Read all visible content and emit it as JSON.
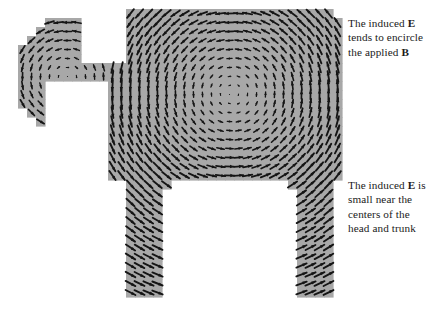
{
  "figure": {
    "name": "induced-electric-field-vector-plot",
    "background_color": "#ffffff",
    "mesh_fill_color": "#a8a8a8",
    "mesh_grid_color": "#9a9a9a",
    "arrow_color": "#151515"
  },
  "annotations": [
    {
      "id": "encircle",
      "lines": [
        "The induced E",
        "tends to encircle",
        "the applied B"
      ],
      "bold_tokens": [
        "E",
        "B"
      ]
    },
    {
      "id": "centers",
      "lines": [
        "The induced E is",
        "small near the",
        "centers of the",
        "head and trunk"
      ],
      "bold_tokens": [
        "E"
      ]
    }
  ],
  "field_data": {
    "type": "vector_field",
    "circulation": "clockwise",
    "note": "E encircles applied B; magnitude grows with distance from circulation center and vanishes at centers of head and trunk",
    "grid_spacing": 9,
    "arrow_scale": 9.0,
    "max_arrow_length": 11,
    "regions": [
      {
        "name": "trunk",
        "role": "main body, large clockwise circulation",
        "center": [
          232,
          93
        ],
        "strength": 1.0,
        "falloff": 74,
        "cells": [
          {
            "x0": 126,
            "y0": 8,
            "x1": 331,
            "y1": 17
          },
          {
            "x0": 120,
            "y0": 17,
            "x1": 338,
            "y1": 26
          },
          {
            "x0": 114,
            "y0": 26,
            "x1": 343,
            "y1": 35
          },
          {
            "x0": 108,
            "y0": 35,
            "x1": 343,
            "y1": 62
          },
          {
            "x0": 104,
            "y0": 62,
            "x1": 343,
            "y1": 71
          },
          {
            "x0": 104,
            "y0": 71,
            "x1": 344,
            "y1": 160
          },
          {
            "x0": 104,
            "y0": 160,
            "x1": 344,
            "y1": 178
          }
        ]
      },
      {
        "name": "head",
        "role": "secondary clockwise circulation, small field at center",
        "center": [
          67,
          78
        ],
        "strength": 0.62,
        "falloff": 34,
        "cells": [
          {
            "x0": 46,
            "y0": 20,
            "x1": 84,
            "y1": 29
          },
          {
            "x0": 38,
            "y0": 29,
            "x1": 92,
            "y1": 38
          },
          {
            "x0": 30,
            "y0": 38,
            "x1": 100,
            "y1": 47
          },
          {
            "x0": 22,
            "y0": 47,
            "x1": 104,
            "y1": 56
          },
          {
            "x0": 18,
            "y0": 56,
            "x1": 104,
            "y1": 101
          },
          {
            "x0": 22,
            "y0": 101,
            "x1": 104,
            "y1": 110
          },
          {
            "x0": 30,
            "y0": 110,
            "x1": 100,
            "y1": 119
          },
          {
            "x0": 38,
            "y0": 119,
            "x1": 92,
            "y1": 128
          },
          {
            "x0": 46,
            "y0": 128,
            "x1": 84,
            "y1": 137
          },
          {
            "x0": 54,
            "y0": 137,
            "x1": 76,
            "y1": 146
          }
        ]
      },
      {
        "name": "left-leg",
        "role": "weak downward field",
        "center": [
          232,
          93
        ],
        "strength": 1.0,
        "falloff": 74,
        "cells": [
          {
            "x0": 123,
            "y0": 178,
            "x1": 168,
            "y1": 187
          },
          {
            "x0": 123,
            "y0": 187,
            "x1": 162,
            "y1": 300
          }
        ]
      },
      {
        "name": "right-leg",
        "role": "weak upward field",
        "center": [
          232,
          93
        ],
        "strength": 1.0,
        "falloff": 74,
        "cells": [
          {
            "x0": 288,
            "y0": 178,
            "x1": 332,
            "y1": 187
          },
          {
            "x0": 294,
            "y0": 187,
            "x1": 332,
            "y1": 300
          }
        ]
      }
    ],
    "holes": [
      {
        "name": "neck-gap-below",
        "x0": 46,
        "y0": 83,
        "x1": 104,
        "y1": 150
      },
      {
        "name": "neck-gap-above",
        "x0": 84,
        "y0": 0,
        "x1": 126,
        "y1": 62
      },
      {
        "name": "right-notch",
        "x0": 344,
        "y0": 71,
        "x1": 372,
        "y1": 166
      },
      {
        "name": "between-legs",
        "x0": 168,
        "y0": 187,
        "x1": 288,
        "y1": 316
      }
    ]
  }
}
